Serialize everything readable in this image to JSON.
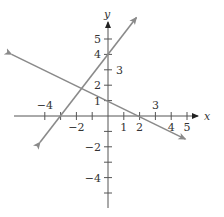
{
  "graph": {
    "x_axis_label": "x",
    "y_axis_label": "y",
    "x_tick_labels": [
      {
        "value": -4,
        "text": "−4",
        "pos": "above"
      },
      {
        "value": -2,
        "text": "−2",
        "pos": "below"
      },
      {
        "value": 1,
        "text": "1",
        "pos": "below"
      },
      {
        "value": 2,
        "text": "2",
        "pos": "below"
      },
      {
        "value": 3,
        "text": "3",
        "pos": "above"
      },
      {
        "value": 4,
        "text": "4",
        "pos": "below"
      },
      {
        "value": 5,
        "text": "5",
        "pos": "below"
      }
    ],
    "y_tick_labels": [
      {
        "value": 5,
        "text": "5",
        "pos": "left"
      },
      {
        "value": 4,
        "text": "4",
        "pos": "left"
      },
      {
        "value": 3,
        "text": "3",
        "pos": "right"
      },
      {
        "value": 2,
        "text": "2",
        "pos": "left"
      },
      {
        "value": 1,
        "text": "1",
        "pos": "left"
      },
      {
        "value": -2,
        "text": "−2",
        "pos": "left"
      },
      {
        "value": -4,
        "text": "−4",
        "pos": "left"
      }
    ],
    "x_ticks": [
      -4,
      -3,
      -2,
      -1,
      1,
      2,
      3,
      4,
      5
    ],
    "y_ticks": [
      -5,
      -4,
      -3,
      -2,
      -1,
      1,
      2,
      3,
      4,
      5
    ],
    "lines": [
      {
        "name": "line-rising",
        "equation": "y = (4/3)x + 4",
        "points": [
          [
            -0.0,
            4
          ],
          [
            -3,
            0
          ]
        ],
        "color": "#808080"
      },
      {
        "name": "line-falling",
        "equation": "y = -x/2 + 1",
        "points": [
          [
            0,
            1
          ],
          [
            2,
            0
          ]
        ],
        "color": "#808080"
      }
    ],
    "axis_color": "#555555",
    "line_color": "#8a8a8a"
  },
  "chart_data": {
    "type": "line",
    "title": "",
    "xlabel": "x",
    "ylabel": "y",
    "xlim": [
      -6,
      6
    ],
    "ylim": [
      -6,
      6
    ],
    "grid": false,
    "series": [
      {
        "name": "Line 1 (rising)",
        "slope": 1.3333,
        "intercept": 4,
        "x": [
          -4.3,
          1.8
        ],
        "y": [
          -1.7,
          6.4
        ]
      },
      {
        "name": "Line 2 (falling)",
        "slope": -0.5,
        "intercept": 1,
        "x": [
          -6.1,
          4.9
        ],
        "y": [
          4.0,
          -1.5
        ]
      }
    ],
    "annotations": [
      "y-intercepts at 4 and 1",
      "x-intercepts at -3 and 2",
      "lines intersect near (-1.6, 1.8)"
    ]
  }
}
